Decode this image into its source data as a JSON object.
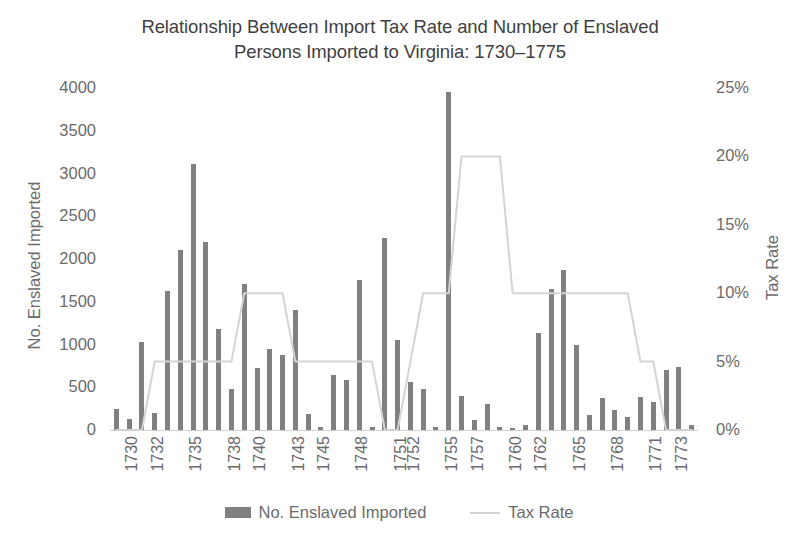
{
  "title": {
    "line1": "Relationship Between Import Tax Rate and Number of Enslaved",
    "line2": "Persons Imported to Virginia: 1730–1775"
  },
  "axes": {
    "y_left_title": "No. Enslaved Imported",
    "y_right_title": "Tax Rate",
    "y_left_ticks": [
      "4000",
      "3500",
      "3000",
      "2500",
      "2000",
      "1500",
      "1000",
      "500",
      "0"
    ],
    "y_right_ticks": [
      "25%",
      "20%",
      "15%",
      "10%",
      "5%",
      "0%"
    ],
    "x_visible_ticks": [
      "1730",
      "1732",
      "1735",
      "1738",
      "1740",
      "1743",
      "1745",
      "1748",
      "1751",
      "1752",
      "1755",
      "1757",
      "1760",
      "1762",
      "1765",
      "1768",
      "1771",
      "1773"
    ]
  },
  "legend": {
    "items": [
      {
        "label": "No. Enslaved Imported",
        "marker": "bar-swatch",
        "color": "#808080"
      },
      {
        "label": "Tax Rate",
        "marker": "line-swatch",
        "color": "#d4d4d4"
      }
    ]
  },
  "colors": {
    "bar": "#808080",
    "line": "#d4d4d4",
    "text": "#6b6b6b",
    "title": "#3f3f3f",
    "background": "#ffffff"
  },
  "chart_data": {
    "type": "bar",
    "title": "Relationship Between Import Tax Rate and Number of Enslaved Persons Imported to Virginia: 1730–1775",
    "xlabel": "",
    "ylabel": "No. Enslaved Imported",
    "y2label": "Tax Rate",
    "ylim": [
      0,
      4000
    ],
    "y2lim": [
      0,
      25
    ],
    "ytick_step": 500,
    "y2tick_step": 5,
    "grid": false,
    "legend_position": "bottom",
    "categories": [
      1730,
      1731,
      1732,
      1733,
      1734,
      1735,
      1736,
      1737,
      1738,
      1739,
      1740,
      1741,
      1742,
      1743,
      1744,
      1745,
      1746,
      1747,
      1748,
      1749,
      1750,
      1751,
      1752,
      1753,
      1754,
      1755,
      1756,
      1757,
      1758,
      1759,
      1760,
      1761,
      1762,
      1763,
      1764,
      1765,
      1766,
      1767,
      1768,
      1769,
      1770,
      1771,
      1772,
      1773,
      1774,
      1775
    ],
    "series": [
      {
        "name": "No. Enslaved Imported",
        "type": "bar",
        "axis": "left",
        "color": "#808080",
        "values": [
          250,
          130,
          1030,
          200,
          1630,
          2110,
          3110,
          2200,
          1180,
          480,
          1710,
          730,
          950,
          880,
          1400,
          190,
          40,
          640,
          580,
          1750,
          30,
          2250,
          1050,
          560,
          480,
          30,
          3950,
          400,
          120,
          300,
          30,
          20,
          60,
          1130,
          1650,
          1870,
          990,
          180,
          380,
          230,
          150,
          390,
          330,
          700,
          740,
          60
        ]
      },
      {
        "name": "Tax Rate",
        "type": "line",
        "axis": "right",
        "color": "#d4d4d4",
        "unit": "%",
        "values": [
          0,
          0,
          0,
          5,
          5,
          5,
          5,
          5,
          5,
          5,
          10,
          10,
          10,
          10,
          5,
          5,
          5,
          5,
          5,
          5,
          5,
          0,
          0,
          5,
          10,
          10,
          10,
          20,
          20,
          20,
          20,
          10,
          10,
          10,
          10,
          10,
          10,
          10,
          10,
          10,
          10,
          5,
          5,
          0,
          0,
          0
        ]
      }
    ]
  }
}
